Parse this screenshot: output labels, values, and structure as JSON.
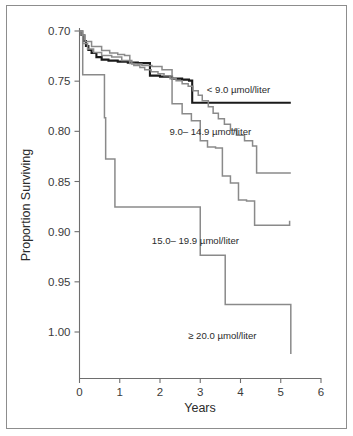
{
  "figure": {
    "kind": "kaplan-meier-survival-plot",
    "background_color": "#ffffff",
    "border_color": "#8d8d8d"
  },
  "axes": {
    "y_title": "Proportion Surviving",
    "x_title": "Years",
    "y_ticks": [
      "1.00",
      "0.95",
      "0.90",
      "0.85",
      "0.80",
      "0.75",
      "0.70"
    ],
    "x_ticks": [
      "0",
      "1",
      "2",
      "3",
      "4",
      "5",
      "6"
    ]
  },
  "labels": {
    "series1": "< 9.0 µmol/liter",
    "series2": "9.0– 14.9 µmol/liter",
    "series3": "15.0– 19.9 µmol/liter",
    "series4": "≥ 20.0 µmol/liter"
  },
  "chart_data": {
    "type": "line",
    "title": "",
    "subtitle": "",
    "xlabel": "Years",
    "ylabel": "Proportion Surviving",
    "xlim": [
      0,
      6
    ],
    "ylim": [
      0.67,
      1.005
    ],
    "xticks": [
      0,
      1,
      2,
      3,
      4,
      5,
      6
    ],
    "yticks": [
      0.7,
      0.75,
      0.8,
      0.85,
      0.9,
      0.95,
      1.0
    ],
    "grid": false,
    "legend": "inline-annotations",
    "step_style": "post",
    "series": [
      {
        "name": "< 9.0 µmol/liter",
        "color": "#1a1a1a",
        "width": 2.1,
        "label_x": 3.95,
        "label_y": 0.9385,
        "x": [
          0,
          0.05,
          0.1,
          0.16,
          0.22,
          0.3,
          0.42,
          0.55,
          0.72,
          0.95,
          1.2,
          1.45,
          1.75,
          2.0,
          2.3,
          2.55,
          2.72,
          2.8,
          5.25
        ],
        "y": [
          1.0,
          0.996,
          0.99,
          0.985,
          0.981,
          0.978,
          0.974,
          0.9715,
          0.9705,
          0.9695,
          0.9685,
          0.968,
          0.9555,
          0.9545,
          0.9525,
          0.9515,
          0.9505,
          0.9285,
          0.9285
        ]
      },
      {
        "name": "9.0– 14.9 µmol/liter",
        "color": "#8a8a8a",
        "width": 1.5,
        "label_x": 3.25,
        "label_y": 0.8965,
        "x": [
          0,
          0.06,
          0.14,
          0.3,
          0.55,
          0.75,
          0.95,
          1.12,
          1.25,
          1.35,
          1.5,
          1.62,
          1.78,
          1.95,
          2.1,
          2.25,
          2.4,
          2.55,
          2.7,
          2.82,
          2.95,
          3.05,
          3.2,
          3.32,
          3.45,
          3.6,
          3.75,
          3.9,
          4.1,
          4.3,
          4.4,
          5.25
        ],
        "y": [
          1.0,
          0.996,
          0.9895,
          0.9845,
          0.9805,
          0.978,
          0.9765,
          0.9755,
          0.9675,
          0.9655,
          0.9635,
          0.9615,
          0.9595,
          0.9575,
          0.9555,
          0.9525,
          0.9505,
          0.9475,
          0.945,
          0.9405,
          0.936,
          0.9305,
          0.9245,
          0.918,
          0.9125,
          0.907,
          0.901,
          0.896,
          0.8905,
          0.8855,
          0.8585,
          0.8585
        ]
      },
      {
        "name": "15.0– 19.9 µmol/liter",
        "color": "#8a8a8a",
        "width": 1.5,
        "label_x": 2.88,
        "label_y": 0.7875,
        "x": [
          0,
          0.08,
          0.2,
          0.35,
          0.55,
          0.8,
          1.05,
          1.3,
          1.55,
          1.8,
          2.05,
          2.3,
          2.55,
          2.78,
          3.0,
          3.18,
          3.38,
          3.55,
          3.75,
          3.95,
          4.15,
          4.35,
          5.0,
          5.22
        ],
        "y": [
          1.0,
          0.9875,
          0.982,
          0.9785,
          0.9755,
          0.974,
          0.9705,
          0.967,
          0.9655,
          0.9645,
          0.9615,
          0.9275,
          0.9175,
          0.9105,
          0.8905,
          0.8845,
          0.8835,
          0.8555,
          0.8485,
          0.8315,
          0.8305,
          0.8065,
          0.8065,
          0.811
        ]
      },
      {
        "name": "≥ 20.0 µmol/liter",
        "color": "#8a8a8a",
        "width": 1.5,
        "label_x": 3.55,
        "label_y": 0.6935,
        "x": [
          0,
          0.08,
          0.5,
          0.62,
          0.65,
          0.88,
          3.0,
          3.1,
          3.62,
          3.68,
          5.25
        ],
        "y": [
          1.0,
          0.9565,
          0.9565,
          0.9135,
          0.8725,
          0.8245,
          0.7765,
          0.7765,
          0.7275,
          0.7275,
          0.678
        ]
      }
    ]
  }
}
